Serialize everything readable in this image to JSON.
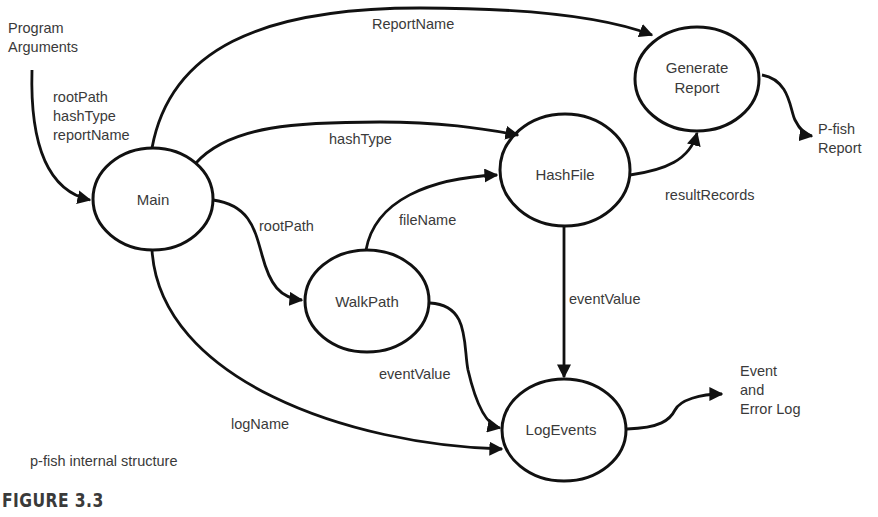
{
  "figure": {
    "label": "FIGURE 3.3",
    "caption": "p-fish internal structure"
  },
  "nodes": {
    "main": {
      "label": "Main"
    },
    "hashfile": {
      "label": "HashFile"
    },
    "generate_report": {
      "label": "Generate\nReport"
    },
    "walkpath": {
      "label": "WalkPath"
    },
    "logevents": {
      "label": "LogEvents"
    }
  },
  "externals": {
    "program_arguments": "Program\nArguments",
    "pfish_report": "P-fish\nReport",
    "event_log": "Event\nand\nError Log"
  },
  "edges": {
    "args_to_main": "rootPath\nhashType\nreportName",
    "main_to_report": "ReportName",
    "main_to_hashfile": "hashType",
    "main_to_walkpath": "rootPath",
    "walkpath_to_hashfile": "fileName",
    "hashfile_to_report": "resultRecords",
    "hashfile_to_logevents": "eventValue",
    "walkpath_to_logevents": "eventValue",
    "main_to_logevents": "logName"
  },
  "colors": {
    "stroke": "#111111",
    "text": "#3a3a3a",
    "background": "#ffffff"
  }
}
